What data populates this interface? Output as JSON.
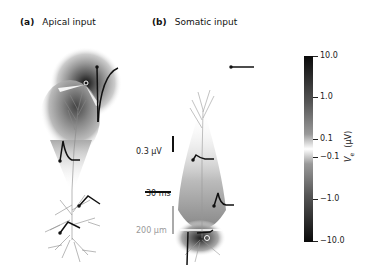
{
  "panels": [
    {
      "id": "a",
      "tag": "(a)",
      "title": "Apical input"
    },
    {
      "id": "b",
      "tag": "(b)",
      "title": "Somatic input"
    }
  ],
  "scale_bars": {
    "voltage": "0.3 μV",
    "time": "30 ms",
    "length": "200 μm"
  },
  "colorbar": {
    "label": "V_e (μV)",
    "label_main": "V",
    "label_sub": "e",
    "label_unit": "(μV)",
    "ticks": [
      "10.0",
      "1.0",
      "0.1",
      "−0.1",
      "−1.0",
      "−10.0"
    ],
    "colors": {
      "top": "#0a0a0a",
      "middle": "#ffffff",
      "bottom": "#0a0a0a"
    }
  }
}
